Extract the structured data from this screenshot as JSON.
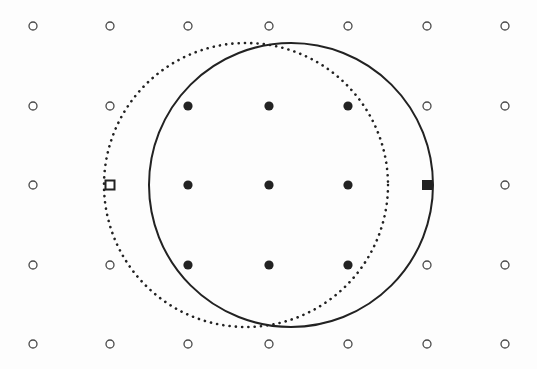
{
  "figure": {
    "width": 537,
    "height": 369,
    "background": "#fdfdfd",
    "ink": "#222222",
    "open_marker_color": "#4a4a4a"
  },
  "grid": {
    "columns_x": [
      33,
      110,
      188,
      269,
      348,
      427,
      505
    ],
    "rows_y": [
      26,
      106,
      185,
      265,
      344
    ],
    "points": [
      {
        "col": 0,
        "row": 0,
        "type": "open-circle"
      },
      {
        "col": 1,
        "row": 0,
        "type": "open-circle"
      },
      {
        "col": 2,
        "row": 0,
        "type": "open-circle"
      },
      {
        "col": 3,
        "row": 0,
        "type": "open-circle"
      },
      {
        "col": 4,
        "row": 0,
        "type": "open-circle"
      },
      {
        "col": 5,
        "row": 0,
        "type": "open-circle"
      },
      {
        "col": 6,
        "row": 0,
        "type": "open-circle"
      },
      {
        "col": 0,
        "row": 1,
        "type": "open-circle"
      },
      {
        "col": 1,
        "row": 1,
        "type": "open-circle"
      },
      {
        "col": 2,
        "row": 1,
        "type": "filled-circle"
      },
      {
        "col": 3,
        "row": 1,
        "type": "filled-circle"
      },
      {
        "col": 4,
        "row": 1,
        "type": "filled-circle"
      },
      {
        "col": 5,
        "row": 1,
        "type": "open-circle"
      },
      {
        "col": 6,
        "row": 1,
        "type": "open-circle"
      },
      {
        "col": 0,
        "row": 2,
        "type": "open-circle"
      },
      {
        "col": 1,
        "row": 2,
        "type": "open-square"
      },
      {
        "col": 2,
        "row": 2,
        "type": "filled-circle"
      },
      {
        "col": 3,
        "row": 2,
        "type": "filled-circle"
      },
      {
        "col": 4,
        "row": 2,
        "type": "filled-circle"
      },
      {
        "col": 5,
        "row": 2,
        "type": "filled-square"
      },
      {
        "col": 6,
        "row": 2,
        "type": "open-circle"
      },
      {
        "col": 0,
        "row": 3,
        "type": "open-circle"
      },
      {
        "col": 1,
        "row": 3,
        "type": "open-circle"
      },
      {
        "col": 2,
        "row": 3,
        "type": "filled-circle"
      },
      {
        "col": 3,
        "row": 3,
        "type": "filled-circle"
      },
      {
        "col": 4,
        "row": 3,
        "type": "filled-circle"
      },
      {
        "col": 5,
        "row": 3,
        "type": "open-circle"
      },
      {
        "col": 6,
        "row": 3,
        "type": "open-circle"
      },
      {
        "col": 0,
        "row": 4,
        "type": "open-circle"
      },
      {
        "col": 1,
        "row": 4,
        "type": "open-circle"
      },
      {
        "col": 2,
        "row": 4,
        "type": "open-circle"
      },
      {
        "col": 3,
        "row": 4,
        "type": "open-circle"
      },
      {
        "col": 4,
        "row": 4,
        "type": "open-circle"
      },
      {
        "col": 5,
        "row": 4,
        "type": "open-circle"
      },
      {
        "col": 6,
        "row": 4,
        "type": "open-circle"
      }
    ]
  },
  "circles": [
    {
      "name": "dotted-circle",
      "cx": 246,
      "cy": 185,
      "r": 142,
      "style": "dotted"
    },
    {
      "name": "solid-circle",
      "cx": 291,
      "cy": 185,
      "r": 142,
      "style": "solid"
    }
  ],
  "markers": {
    "open_circle_r": 4,
    "filled_circle_r": 4.6,
    "open_square_size": 9,
    "filled_square_size": 10
  }
}
